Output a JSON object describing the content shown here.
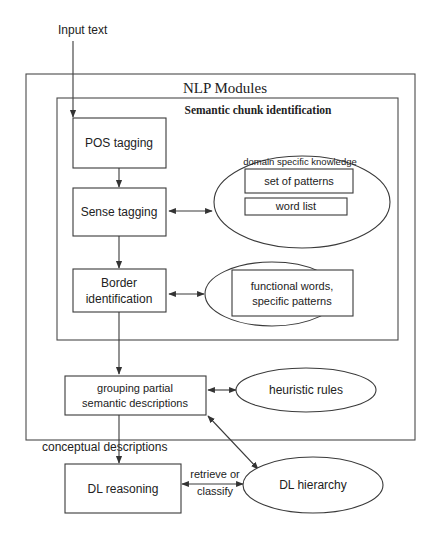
{
  "diagram": {
    "input_label": "Input text",
    "outer_module": {
      "title": "NLP Modules"
    },
    "inner_module": {
      "title": "Semantic chunk identification"
    },
    "nodes": {
      "pos_tagging": {
        "label": "POS tagging"
      },
      "sense_tagging": {
        "label": "Sense tagging"
      },
      "border_identification": {
        "line1": "Border",
        "line2": "identification"
      },
      "grouping": {
        "line1": "grouping partial",
        "line2": "semantic descriptions"
      },
      "dl_reasoning": {
        "label": "DL reasoning"
      }
    },
    "knowledge": {
      "domain": {
        "title": "domain specific knowledge",
        "items": [
          "set of patterns",
          "word list"
        ]
      },
      "functional": {
        "line1": "functional words,",
        "line2": "specific patterns"
      },
      "heuristic": {
        "label": "heuristic rules"
      },
      "dl_hierarchy": {
        "label": "DL hierarchy"
      }
    },
    "edge_labels": {
      "conceptual": "conceptual descriptions",
      "retrieve_line1": "retrieve or",
      "retrieve_line2": "classify"
    },
    "colors": {
      "stroke": "#3a3a3a",
      "text": "#222222",
      "background": "#ffffff"
    }
  }
}
